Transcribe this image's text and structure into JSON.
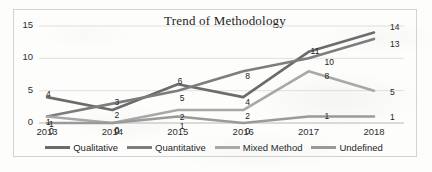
{
  "chart_data": {
    "type": "line",
    "title": "Trend of Methodology",
    "xlabel": "",
    "ylabel": "",
    "categories": [
      "2013",
      "2014",
      "2015",
      "2016",
      "2017",
      "2018"
    ],
    "yticks": [
      "0",
      "5",
      "10",
      "15"
    ],
    "ylim": [
      0,
      15
    ],
    "grid": true,
    "legend_position": "bottom",
    "data_labels": true,
    "series": [
      {
        "name": "Qualitative",
        "color": "#6b6b6b",
        "values": [
          4,
          2,
          6,
          4,
          11,
          14
        ]
      },
      {
        "name": "Quantitative",
        "color": "#7d7d7d",
        "values": [
          1,
          3,
          5,
          8,
          10,
          13
        ]
      },
      {
        "name": "Mixed Method",
        "color": "#a8a8a8",
        "values": [
          1,
          0,
          2,
          2,
          8,
          5
        ]
      },
      {
        "name": "Undefined",
        "color": "#9a9a9a",
        "values": [
          0,
          0,
          1,
          0,
          1,
          1
        ]
      }
    ]
  }
}
